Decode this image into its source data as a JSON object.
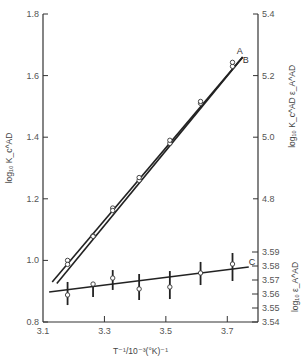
{
  "chart_data": {
    "type": "line",
    "title": "",
    "xlabel": "T⁻¹/10⁻³(°K)⁻¹",
    "ylabel_left": "log₁₀ K_c^AD",
    "ylabel_right_outer": "log₁₀ K_c^AD ε_A^AD",
    "ylabel_right_inner": "log₁₀ ε_A^AD",
    "xlim": [
      3.1,
      3.8
    ],
    "ylim_left": [
      0.8,
      1.8
    ],
    "ylim_right_outer": [
      4.4,
      5.4
    ],
    "ylim_right_inner": [
      3.54,
      3.59
    ],
    "x_ticks": [
      "3.1",
      "3.3",
      "3.5",
      "3.7"
    ],
    "x_tick_values": [
      3.1,
      3.3,
      3.5,
      3.7
    ],
    "y_ticks_left": [
      "0.8",
      "1.0",
      "1.2",
      "1.4",
      "1.6",
      "1.8"
    ],
    "y_tick_values_left": [
      0.8,
      1.0,
      1.2,
      1.4,
      1.6,
      1.8
    ],
    "y_ticks_right_outer": [
      "4.8",
      "5.0",
      "5.2",
      "5.4"
    ],
    "y_tick_values_right_outer": [
      4.8,
      5.0,
      5.2,
      5.4
    ],
    "y_ticks_right_inner": [
      "3.54",
      "3.55",
      "3.56",
      "3.57",
      "3.58",
      "3.59"
    ],
    "y_tick_values_right_inner": [
      3.54,
      3.55,
      3.56,
      3.57,
      3.58,
      3.59
    ],
    "grid": false,
    "series": [
      {
        "name": "A",
        "axis": "right_outer",
        "x": [
          3.18,
          3.263,
          3.327,
          3.413,
          3.513,
          3.613,
          3.717
        ],
        "y": [
          4.6,
          4.68,
          4.77,
          4.86,
          4.98,
          5.11,
          5.23
        ],
        "fit_line": {
          "x": [
            3.13,
            3.75
          ],
          "y": [
            4.53,
            5.26
          ]
        }
      },
      {
        "name": "B",
        "axis": "left",
        "x": [
          3.18,
          3.263,
          3.327,
          3.413,
          3.513,
          3.613,
          3.717
        ],
        "y": [
          0.987,
          1.078,
          1.162,
          1.269,
          1.39,
          1.516,
          1.643
        ],
        "fit_line": {
          "x": [
            3.145,
            3.75
          ],
          "y": [
            0.925,
            1.66
          ]
        }
      },
      {
        "name": "C",
        "axis": "right_inner",
        "x": [
          3.18,
          3.263,
          3.327,
          3.413,
          3.513,
          3.613,
          3.717
        ],
        "y": [
          3.5593,
          3.5671,
          3.5714,
          3.5636,
          3.565,
          3.575,
          3.5814
        ],
        "y_err_low": [
          3.5521,
          3.5579,
          3.5629,
          3.5557,
          3.5564,
          3.5664,
          3.5693
        ],
        "y_err_high": [
          3.5686,
          3.5664,
          3.5771,
          3.5743,
          3.5764,
          3.5829,
          3.5893
        ],
        "fit_line": {
          "x": [
            3.12,
            3.77
          ],
          "y": [
            3.5614,
            3.5793
          ]
        }
      }
    ]
  }
}
